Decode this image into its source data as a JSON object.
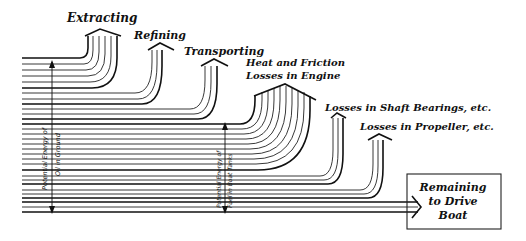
{
  "diagram": {
    "type": "sankey-energy-flow",
    "losses": [
      {
        "label": "Extracting"
      },
      {
        "label": "Refining"
      },
      {
        "label": "Transporting"
      },
      {
        "label_line1": "Heat and Friction",
        "label_line2": "Losses in Engine"
      },
      {
        "label": "Losses in Shaft Bearings, etc."
      },
      {
        "label": "Losses in Propeller, etc."
      }
    ],
    "measures": {
      "oil_in_ground": {
        "line1": "Potential Energy of",
        "line2": "Oil in Ground"
      },
      "fuel_in_tanks": {
        "line1": "Potential Energy of",
        "line2": "Fuel in Boat Tanks"
      }
    },
    "output": {
      "line1": "Remaining",
      "line2": "to Drive",
      "line3": "Boat"
    }
  }
}
